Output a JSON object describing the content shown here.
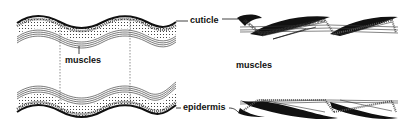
{
  "diagram": {
    "labels": {
      "cuticle": "cuticle",
      "muscles_left": "muscles",
      "muscles_right": "muscles",
      "epidermis": "epidermis"
    },
    "panels": [
      {
        "name": "relaxed-body-wall",
        "description": "wavy cuticle and epidermis with longitudinal muscles"
      },
      {
        "name": "contracted-body-wall",
        "description": "sheared cuticle with overlapping black wedges"
      }
    ],
    "colors": {
      "ink": "#111111",
      "background": "#ffffff"
    }
  }
}
